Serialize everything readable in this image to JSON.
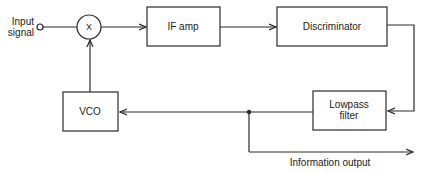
{
  "diagram": {
    "title": "",
    "labels": {
      "input_signal_line1": "Input",
      "input_signal_line2": "signal",
      "mixer": "X",
      "if_amp": "IF amp",
      "discriminator": "Discriminator",
      "lowpass_line1": "Lowpass",
      "lowpass_line2": "filter",
      "vco": "VCO",
      "information_output": "Information output"
    },
    "colors": {
      "stroke": "#2a2a2a",
      "background": "#ffffff"
    },
    "blocks": [
      {
        "id": "mixer",
        "label": "X",
        "shape": "circle"
      },
      {
        "id": "if_amp",
        "label": "IF amp",
        "shape": "rect"
      },
      {
        "id": "discriminator",
        "label": "Discriminator",
        "shape": "rect"
      },
      {
        "id": "lowpass_filter",
        "label": "Lowpass filter",
        "shape": "rect"
      },
      {
        "id": "vco",
        "label": "VCO",
        "shape": "rect"
      }
    ],
    "connections": [
      {
        "from": "input_signal",
        "to": "mixer"
      },
      {
        "from": "mixer",
        "to": "if_amp"
      },
      {
        "from": "if_amp",
        "to": "discriminator"
      },
      {
        "from": "discriminator",
        "to": "lowpass_filter"
      },
      {
        "from": "lowpass_filter",
        "to": "vco"
      },
      {
        "from": "vco",
        "to": "mixer"
      },
      {
        "from": "lowpass_filter",
        "to": "information_output"
      }
    ]
  }
}
